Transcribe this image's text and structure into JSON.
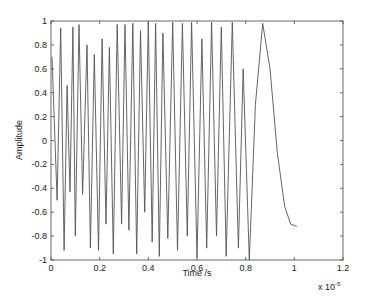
{
  "chart_data": {
    "type": "line",
    "title": "",
    "xlabel": "Time /s",
    "ylabel": "Amplitude",
    "x_multiplier_label": "x 10",
    "x_multiplier_exponent": "-5",
    "xlim": [
      0,
      1.2
    ],
    "ylim": [
      -1,
      1
    ],
    "x_ticks": [
      0,
      0.2,
      0.4,
      0.6,
      0.8,
      1,
      1.2
    ],
    "x_tick_labels": [
      "0",
      "0.2",
      "0.4",
      "0.6",
      "0.8",
      "1",
      "1.2"
    ],
    "y_ticks": [
      -1,
      -0.8,
      -0.6,
      -0.4,
      -0.2,
      0,
      0.2,
      0.4,
      0.6,
      0.8,
      1
    ],
    "y_tick_labels": [
      "-1",
      "-0.8",
      "-0.6",
      "-0.4",
      "-0.2",
      "0",
      "0.2",
      "0.4",
      "0.6",
      "0.8",
      "1"
    ],
    "grid": false,
    "legend": null,
    "line_color": "#555555",
    "series": [
      {
        "name": "signal",
        "x": [
          0.004,
          0.025,
          0.04,
          0.054,
          0.066,
          0.078,
          0.09,
          0.1,
          0.115,
          0.13,
          0.148,
          0.162,
          0.178,
          0.195,
          0.21,
          0.226,
          0.24,
          0.256,
          0.272,
          0.29,
          0.304,
          0.32,
          0.336,
          0.352,
          0.368,
          0.385,
          0.4,
          0.416,
          0.43,
          0.445,
          0.46,
          0.48,
          0.5,
          0.52,
          0.54,
          0.56,
          0.578,
          0.6,
          0.62,
          0.64,
          0.66,
          0.68,
          0.7,
          0.72,
          0.745,
          0.77,
          0.79,
          0.815,
          0.84,
          0.87,
          0.9,
          0.93,
          0.96,
          0.985,
          1.01
        ],
        "y": [
          0.7,
          -0.5,
          0.94,
          -0.92,
          0.46,
          -0.43,
          0.95,
          -0.8,
          0.97,
          -0.45,
          0.8,
          -0.9,
          0.72,
          -0.92,
          0.85,
          -0.7,
          0.78,
          -0.95,
          0.97,
          -0.7,
          0.97,
          -0.75,
          0.98,
          -0.95,
          0.92,
          -0.6,
          0.99,
          -0.85,
          0.98,
          -0.97,
          0.9,
          -0.82,
          0.99,
          -0.92,
          0.98,
          -0.8,
          0.99,
          -0.98,
          0.85,
          -0.9,
          0.99,
          -0.8,
          0.95,
          -0.97,
          0.99,
          -0.9,
          0.6,
          -1.0,
          0.3,
          0.98,
          0.6,
          -0.1,
          -0.55,
          -0.7,
          -0.72
        ]
      }
    ]
  }
}
